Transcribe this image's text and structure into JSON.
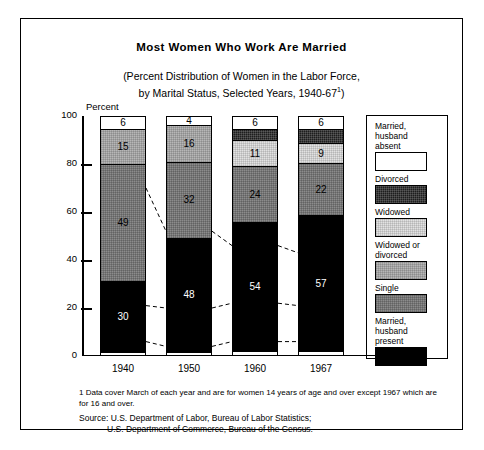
{
  "chart_data": {
    "type": "bar",
    "title": "Most Women Who Work Are Married",
    "subtitle_line1": "(Percent Distribution of Women in the Labor Force,",
    "subtitle_line2": "by Marital Status, Selected Years, 1940-67",
    "subtitle_footnote_mark": "1",
    "subtitle_close": ")",
    "xlabel": "",
    "ylabel": "Percent",
    "ylim": [
      0,
      100
    ],
    "yticks": [
      0,
      20,
      40,
      60,
      80,
      100
    ],
    "grid": false,
    "stacked": true,
    "legend_position": "right",
    "categories": [
      "1940",
      "1950",
      "1960",
      "1967"
    ],
    "series": [
      {
        "name": "Married, husband present",
        "fill": "fill-black",
        "values": [
          30,
          48,
          54,
          57
        ],
        "labels": [
          "30",
          "48",
          "54",
          "57"
        ]
      },
      {
        "name": "Single",
        "fill": "fill-single",
        "values": [
          49,
          32,
          24,
          22
        ],
        "labels": [
          "49",
          "32",
          "24",
          "22"
        ]
      },
      {
        "name": "Widowed or divorced",
        "fill": "fill-widowdiv",
        "values": [
          15,
          16,
          0,
          0
        ],
        "labels": [
          "15",
          "16",
          "",
          ""
        ]
      },
      {
        "name": "Widowed",
        "fill": "fill-widow",
        "values": [
          0,
          0,
          11,
          9
        ],
        "labels": [
          "",
          "",
          "11",
          "9"
        ]
      },
      {
        "name": "Divorced",
        "fill": "fill-divorce",
        "values": [
          0,
          0,
          5,
          6
        ],
        "labels": [
          "",
          "",
          "",
          ""
        ]
      },
      {
        "name": "Married, husband absent",
        "fill": "fill-white",
        "values": [
          6,
          4,
          6,
          6
        ],
        "labels": [
          "6",
          "4",
          "6",
          "6"
        ]
      }
    ],
    "bars": [
      {
        "category": "1940",
        "segments": [
          {
            "label": "6",
            "value": 6,
            "fill": "fill-white"
          },
          {
            "label": "15",
            "value": 15,
            "fill": "fill-widowdiv"
          },
          {
            "label": "49",
            "value": 49,
            "fill": "fill-single"
          },
          {
            "label": "30",
            "value": 30,
            "fill": "fill-black"
          }
        ]
      },
      {
        "category": "1950",
        "segments": [
          {
            "label": "4",
            "value": 4,
            "fill": "fill-white"
          },
          {
            "label": "16",
            "value": 16,
            "fill": "fill-widowdiv"
          },
          {
            "label": "32",
            "value": 32,
            "fill": "fill-single"
          },
          {
            "label": "48",
            "value": 48,
            "fill": "fill-black"
          }
        ]
      },
      {
        "category": "1960",
        "segments": [
          {
            "label": "6",
            "value": 6,
            "fill": "fill-white"
          },
          {
            "label": "",
            "value": 5,
            "fill": "fill-divorce"
          },
          {
            "label": "11",
            "value": 11,
            "fill": "fill-widow"
          },
          {
            "label": "24",
            "value": 24,
            "fill": "fill-single"
          },
          {
            "label": "54",
            "value": 54,
            "fill": "fill-black"
          }
        ]
      },
      {
        "category": "1967",
        "segments": [
          {
            "label": "6",
            "value": 6,
            "fill": "fill-white"
          },
          {
            "label": "",
            "value": 6,
            "fill": "fill-divorce"
          },
          {
            "label": "9",
            "value": 9,
            "fill": "fill-widow"
          },
          {
            "label": "22",
            "value": 22,
            "fill": "fill-single"
          },
          {
            "label": "57",
            "value": 57,
            "fill": "fill-black"
          }
        ]
      }
    ],
    "legend": [
      {
        "label": "Married,\nhusband\nabsent",
        "fill": "fill-white"
      },
      {
        "label": "Divorced",
        "fill": "fill-divorce"
      },
      {
        "label": "Widowed",
        "fill": "fill-widow"
      },
      {
        "label": "Widowed or\ndivorced",
        "fill": "fill-widowdiv"
      },
      {
        "label": "Single",
        "fill": "fill-single"
      },
      {
        "label": "Married,\nhusband\npresent",
        "fill": "fill-black"
      }
    ],
    "footnote": "1 Data cover March of each year and are for women 14 years of age and over except 1967 which are for 16 and over.",
    "source_line1": "Source: U.S. Department of Labor, Bureau of Labor Statistics;",
    "source_line2": "U.S. Department of Commerce, Bureau of the Census."
  }
}
